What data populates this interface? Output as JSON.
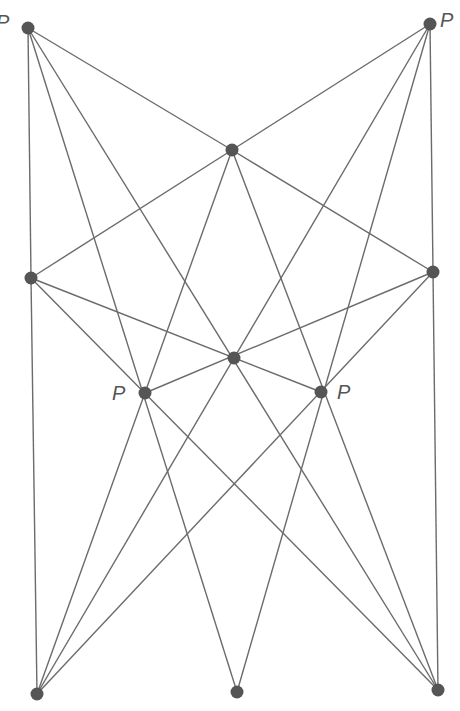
{
  "diagram": {
    "line_color": "#6b6b6b",
    "point_color": "#555555",
    "points": [
      {
        "id": "A",
        "x": 28,
        "y": 28,
        "label": "P",
        "label_pos": [
          -4,
          12
        ]
      },
      {
        "id": "B",
        "x": 430,
        "y": 24,
        "label": "P",
        "label_pos": [
          440,
          10
        ]
      },
      {
        "id": "C",
        "x": 232,
        "y": 150,
        "label": ""
      },
      {
        "id": "D",
        "x": 31,
        "y": 278,
        "label": ""
      },
      {
        "id": "E",
        "x": 433,
        "y": 272,
        "label": ""
      },
      {
        "id": "F",
        "x": 234,
        "y": 358,
        "label": ""
      },
      {
        "id": "G",
        "x": 145,
        "y": 393,
        "label": "P",
        "label_pos": [
          112,
          383
        ]
      },
      {
        "id": "H",
        "x": 321,
        "y": 392,
        "label": "P",
        "label_pos": [
          337,
          382
        ]
      },
      {
        "id": "I",
        "x": 37,
        "y": 694,
        "label": ""
      },
      {
        "id": "J",
        "x": 237,
        "y": 692,
        "label": ""
      },
      {
        "id": "K",
        "x": 438,
        "y": 690,
        "label": ""
      }
    ],
    "segments": [
      [
        "A",
        "D"
      ],
      [
        "D",
        "I"
      ],
      [
        "B",
        "E"
      ],
      [
        "E",
        "K"
      ],
      [
        "A",
        "C"
      ],
      [
        "B",
        "C"
      ],
      [
        "D",
        "C"
      ],
      [
        "E",
        "C"
      ],
      [
        "A",
        "J"
      ],
      [
        "A",
        "K"
      ],
      [
        "B",
        "J"
      ],
      [
        "B",
        "I"
      ],
      [
        "C",
        "I"
      ],
      [
        "C",
        "K"
      ],
      [
        "D",
        "H"
      ],
      [
        "D",
        "K"
      ],
      [
        "E",
        "G"
      ],
      [
        "E",
        "I"
      ]
    ]
  }
}
